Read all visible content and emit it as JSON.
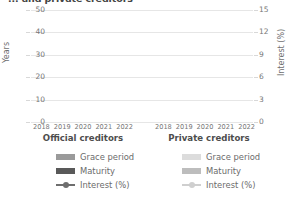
{
  "title": "... and private creditors",
  "axes": {
    "left_label": "Years",
    "right_label": "Interest (%)",
    "left_ticks": [
      "50",
      "40",
      "30",
      "20",
      "10",
      "0"
    ],
    "right_ticks": [
      "15",
      "12",
      "9",
      "6",
      "3",
      "0"
    ]
  },
  "panels": [
    {
      "key": "official",
      "title": "Official creditors",
      "xticks": [
        "2018",
        "2019",
        "2020",
        "2021",
        "2022"
      ],
      "legend": [
        {
          "label": "Grace period",
          "color": "#9a9a9a",
          "marker": "bar"
        },
        {
          "label": "Maturity",
          "color": "#595959",
          "marker": "bar"
        },
        {
          "label": "Interest (%)",
          "color": "#6e6e6e",
          "marker": "line"
        }
      ]
    },
    {
      "key": "private",
      "title": "Private creditors",
      "xticks": [
        "2018",
        "2019",
        "2020",
        "2021",
        "2022"
      ],
      "legend": [
        {
          "label": "Grace period",
          "color": "#dcdcdc",
          "marker": "bar"
        },
        {
          "label": "Maturity",
          "color": "#bdbdbd",
          "marker": "bar"
        },
        {
          "label": "Interest (%)",
          "color": "#cfcfcf",
          "marker": "line"
        }
      ]
    }
  ],
  "chart_data": {
    "type": "bar",
    "title": "... and private creditors",
    "xlabel": "",
    "ylabel": "Years",
    "y2label": "Interest (%)",
    "ylim": [
      0,
      50
    ],
    "y2lim": [
      0,
      15
    ],
    "yticks": [
      0,
      10,
      20,
      30,
      40,
      50
    ],
    "y2ticks": [
      0,
      3,
      6,
      9,
      12,
      15
    ],
    "grid": true,
    "legend_position": "below",
    "categories": [
      "2018",
      "2019",
      "2020",
      "2021",
      "2022"
    ],
    "panels": [
      {
        "name": "Official creditors",
        "series": [
          {
            "name": "Grace period",
            "axis": "left",
            "type": "bar",
            "color": "#9a9a9a",
            "values": [
              null,
              null,
              null,
              null,
              null
            ]
          },
          {
            "name": "Maturity",
            "axis": "left",
            "type": "bar",
            "color": "#595959",
            "values": [
              null,
              null,
              null,
              null,
              null
            ]
          },
          {
            "name": "Interest (%)",
            "axis": "right",
            "type": "line",
            "color": "#6e6e6e",
            "values": [
              null,
              null,
              null,
              null,
              null
            ]
          }
        ]
      },
      {
        "name": "Private creditors",
        "series": [
          {
            "name": "Grace period",
            "axis": "left",
            "type": "bar",
            "color": "#dcdcdc",
            "values": [
              null,
              null,
              null,
              null,
              null
            ]
          },
          {
            "name": "Maturity",
            "axis": "left",
            "type": "bar",
            "color": "#bdbdbd",
            "values": [
              null,
              null,
              null,
              null,
              null
            ]
          },
          {
            "name": "Interest (%)",
            "axis": "right",
            "type": "line",
            "color": "#cfcfcf",
            "values": [
              null,
              null,
              null,
              null,
              null
            ]
          }
        ]
      }
    ],
    "note": "Plot region renders empty in this screenshot: gridlines and axes only, no plotted bars or lines visible."
  }
}
